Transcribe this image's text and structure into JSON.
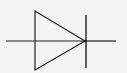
{
  "diagram": {
    "type": "diode-symbol",
    "colors": {
      "background": "#f4f4f4",
      "stroke": "#1e1e1e"
    },
    "lead_left": {
      "x1": 6,
      "y1": 41,
      "x2": 85,
      "y2": 41
    },
    "lead_right": {
      "x1": 86,
      "y1": 41,
      "x2": 116,
      "y2": 41
    },
    "anode_triangle": {
      "points": "35,11 35,70 85,41"
    },
    "cathode_bar": {
      "x1": 86,
      "y1": 15,
      "x2": 86,
      "y2": 68
    }
  }
}
